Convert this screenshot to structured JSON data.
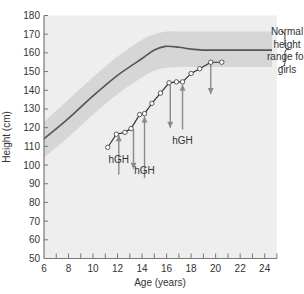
{
  "chart_data": {
    "type": "line",
    "title": "",
    "xlabel": "Age (years)",
    "ylabel": "Height (cm)",
    "xlim": [
      6,
      25
    ],
    "ylim": [
      50,
      180
    ],
    "xticks": [
      6,
      8,
      10,
      12,
      14,
      16,
      18,
      20,
      22,
      24
    ],
    "yticks": [
      50,
      60,
      70,
      80,
      90,
      100,
      110,
      120,
      130,
      140,
      150,
      160,
      170,
      180
    ],
    "grid": false,
    "legend_position": "right annotation",
    "normal_range": {
      "label": "Normal height range for girls",
      "label_lines": [
        "Normal",
        "height",
        "range for",
        "girls"
      ],
      "x": [
        6,
        8,
        10,
        12,
        14,
        15,
        16,
        17,
        18,
        20,
        22,
        24.6
      ],
      "upper": [
        123,
        135,
        147,
        158,
        167,
        170,
        171.5,
        171.5,
        171.5,
        171.5,
        171.5,
        171.5
      ],
      "lower": [
        104,
        115,
        127,
        138,
        147,
        150.5,
        152,
        152.5,
        152.5,
        152.5,
        152.5,
        152.5
      ]
    },
    "series": [
      {
        "name": "Normal median height (girls)",
        "x": [
          6,
          8,
          10,
          12,
          14,
          15,
          15.9,
          17,
          18,
          19,
          20,
          22,
          24.6
        ],
        "y": [
          114,
          125,
          137,
          148,
          157,
          161.5,
          163.5,
          163,
          162,
          161.5,
          161.5,
          161.5,
          161.5
        ],
        "style": "line"
      },
      {
        "name": "Patient height",
        "x": [
          11.2,
          11.9,
          12.6,
          13.1,
          13.8,
          14.2,
          14.8,
          15.5,
          16.2,
          16.8,
          17.3,
          18.0,
          18.7,
          19.6,
          20.5
        ],
        "y": [
          109.5,
          116.5,
          117.5,
          119.5,
          127,
          127.5,
          133,
          138.5,
          144,
          144.5,
          144.5,
          149,
          151.5,
          155,
          155
        ],
        "style": "line+markers"
      }
    ],
    "annotations": [
      {
        "type": "arrow",
        "direction": "up",
        "x": 12.1,
        "y_from": 95,
        "y_to": 116,
        "label": "hGH",
        "label_x": 12.1,
        "label_y": 101
      },
      {
        "type": "arrow",
        "direction": "down",
        "x": 13.3,
        "y_from": 119,
        "y_to": 98
      },
      {
        "type": "arrow",
        "direction": "up",
        "x": 14.2,
        "y_from": 93,
        "y_to": 126,
        "label": "hGH",
        "label_x": 14.2,
        "label_y": 95
      },
      {
        "type": "arrow",
        "direction": "down",
        "x": 16.3,
        "y_from": 143,
        "y_to": 120
      },
      {
        "type": "arrow",
        "direction": "up",
        "x": 17.3,
        "y_from": 119,
        "y_to": 143,
        "label": "hGH",
        "label_x": 17.3,
        "label_y": 111
      },
      {
        "type": "arrow",
        "direction": "down",
        "x": 19.6,
        "y_from": 154,
        "y_to": 138
      }
    ]
  },
  "labels": {
    "xlabel": "Age (years)",
    "ylabel": "Height (cm)",
    "hgh": "hGH",
    "range_lines": [
      "Normal",
      "height",
      "range for",
      "girls"
    ]
  },
  "colors": {
    "plot_bg": "#eeeeee",
    "band": "#d6d6d6",
    "median_line": "#555555",
    "patient_line": "#333333",
    "marker_fill": "#ffffff",
    "arrow": "#8a8a8a",
    "axis": "#777777",
    "text": "#333333"
  }
}
